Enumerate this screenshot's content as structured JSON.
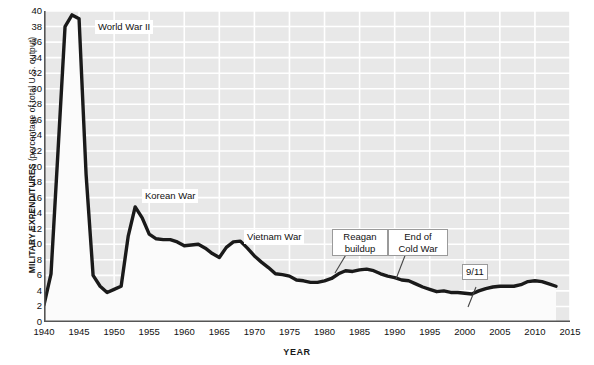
{
  "axes": {
    "y_title_bold": "MILITARY EXPENDITURES",
    "y_title_rest": " (percentage of total U.S. output)",
    "x_title": "YEAR"
  },
  "annotations": [
    {
      "id": "ww2",
      "text": "World War II",
      "boxed": false
    },
    {
      "id": "korean",
      "text": "Korean War",
      "boxed": false
    },
    {
      "id": "vietnam",
      "text": "Vietnam War",
      "boxed": false
    },
    {
      "id": "reagan1",
      "text": "Reagan",
      "boxed": true
    },
    {
      "id": "reagan2",
      "text": "buildup",
      "boxed": true
    },
    {
      "id": "coldwar1",
      "text": "End of",
      "boxed": true
    },
    {
      "id": "coldwar2",
      "text": "Cold War",
      "boxed": true
    },
    {
      "id": "nineeleven",
      "text": "9/11",
      "boxed": true
    }
  ],
  "chart_data": {
    "type": "line",
    "title": "",
    "xlabel": "YEAR",
    "ylabel": "MILITARY EXPENDITURES (percentage of total U.S. output)",
    "xlim": [
      1940,
      2015
    ],
    "ylim": [
      0,
      40
    ],
    "xticks": [
      1940,
      1945,
      1950,
      1955,
      1960,
      1965,
      1970,
      1975,
      1980,
      1985,
      1990,
      1995,
      2000,
      2005,
      2010,
      2015
    ],
    "yticks": [
      0,
      2,
      4,
      6,
      8,
      10,
      12,
      14,
      16,
      18,
      20,
      22,
      24,
      26,
      28,
      30,
      32,
      34,
      36,
      38,
      40
    ],
    "grid": true,
    "legend": "none",
    "line_color": "#1a1a1a",
    "fill_color": "#fbfbfb",
    "plot_bg": "#e8e8e8",
    "gridline_color": "#ffffff",
    "series": [
      {
        "name": "Military expenditures as percentage of total U.S. output",
        "x": [
          1940,
          1941,
          1942,
          1943,
          1944,
          1945,
          1946,
          1947,
          1948,
          1949,
          1950,
          1951,
          1952,
          1953,
          1954,
          1955,
          1956,
          1957,
          1958,
          1959,
          1960,
          1961,
          1962,
          1963,
          1964,
          1965,
          1966,
          1967,
          1968,
          1969,
          1970,
          1971,
          1972,
          1973,
          1974,
          1975,
          1976,
          1977,
          1978,
          1979,
          1980,
          1981,
          1982,
          1983,
          1984,
          1985,
          1986,
          1987,
          1988,
          1989,
          1990,
          1991,
          1992,
          1993,
          1994,
          1995,
          1996,
          1997,
          1998,
          1999,
          2000,
          2001,
          2002,
          2003,
          2004,
          2005,
          2006,
          2007,
          2008,
          2009,
          2010,
          2011,
          2012,
          2013
        ],
        "y": [
          2.2,
          6.2,
          22.0,
          38.0,
          39.5,
          39.0,
          19.0,
          6.0,
          4.6,
          3.8,
          4.2,
          4.6,
          11.0,
          14.8,
          13.4,
          11.3,
          10.7,
          10.6,
          10.6,
          10.3,
          9.8,
          9.9,
          10.0,
          9.5,
          8.8,
          8.3,
          9.6,
          10.3,
          10.4,
          9.5,
          8.5,
          7.7,
          7.0,
          6.2,
          6.1,
          5.9,
          5.4,
          5.3,
          5.1,
          5.1,
          5.3,
          5.6,
          6.2,
          6.6,
          6.5,
          6.7,
          6.8,
          6.6,
          6.2,
          5.9,
          5.7,
          5.4,
          5.3,
          4.9,
          4.5,
          4.2,
          3.9,
          4.0,
          3.8,
          3.8,
          3.7,
          3.6,
          4.0,
          4.3,
          4.5,
          4.6,
          4.6,
          4.6,
          4.8,
          5.2,
          5.3,
          5.2,
          4.9,
          4.6
        ]
      }
    ],
    "annotation_points": [
      {
        "label": "World War II",
        "x": 1945,
        "y": 40.0
      },
      {
        "label": "Korean War",
        "x": 1953,
        "y": 16.0
      },
      {
        "label": "Vietnam War",
        "x": 1969,
        "y": 11.5
      },
      {
        "label": "Reagan buildup",
        "x": 1983,
        "y": 6.6
      },
      {
        "label": "End of Cold War",
        "x": 1990,
        "y": 5.7
      },
      {
        "label": "9/11",
        "x": 2001,
        "y": 3.6
      }
    ]
  }
}
